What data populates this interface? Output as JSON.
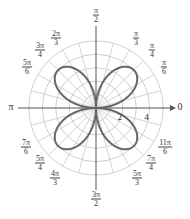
{
  "chart_data": {
    "type": "polar",
    "title": "",
    "equation": "r = 4 sin(2θ)",
    "series": [
      {
        "name": "rose curve",
        "function": "4*abs(sin(2*theta))",
        "petals": 4,
        "max_r": 4,
        "color": "#666666"
      }
    ],
    "radial_axis": {
      "rmax": 5,
      "circles": [
        1,
        2,
        3,
        4,
        5
      ],
      "tick_labels": [
        {
          "value": 2,
          "label": "2"
        },
        {
          "value": 4,
          "label": "4"
        }
      ]
    },
    "angular_axis": {
      "spokes_deg_step": 15,
      "labels": [
        {
          "angle_deg": 0,
          "num": "0",
          "den": ""
        },
        {
          "angle_deg": 30,
          "num": "π",
          "den": "6"
        },
        {
          "angle_deg": 45,
          "num": "π",
          "den": "4"
        },
        {
          "angle_deg": 60,
          "num": "π",
          "den": "3"
        },
        {
          "angle_deg": 90,
          "num": "π",
          "den": "2"
        },
        {
          "angle_deg": 120,
          "num": "2π",
          "den": "3"
        },
        {
          "angle_deg": 135,
          "num": "3π",
          "den": "4"
        },
        {
          "angle_deg": 150,
          "num": "5π",
          "den": "6"
        },
        {
          "angle_deg": 180,
          "num": "π",
          "den": ""
        },
        {
          "angle_deg": 210,
          "num": "7π",
          "den": "6"
        },
        {
          "angle_deg": 225,
          "num": "5π",
          "den": "4"
        },
        {
          "angle_deg": 240,
          "num": "4π",
          "den": "3"
        },
        {
          "angle_deg": 270,
          "num": "3π",
          "den": "2"
        },
        {
          "angle_deg": 300,
          "num": "5π",
          "den": "3"
        },
        {
          "angle_deg": 315,
          "num": "7π",
          "den": "4"
        },
        {
          "angle_deg": 330,
          "num": "11π",
          "den": "6"
        }
      ]
    },
    "grid": true
  },
  "layout": {
    "cx": 96,
    "cy": 108,
    "unit_px": 13.4,
    "label_positions": {
      "0": [
        180,
        106
      ],
      "30": [
        164,
        67
      ],
      "45": [
        152,
        50
      ],
      "60": [
        136,
        38
      ],
      "90": [
        96,
        15
      ],
      "120": [
        56,
        38
      ],
      "135": [
        40,
        50
      ],
      "150": [
        27,
        67
      ],
      "180": [
        11,
        106
      ],
      "210": [
        26,
        147
      ],
      "225": [
        40,
        163
      ],
      "240": [
        55,
        178
      ],
      "270": [
        96,
        199
      ],
      "300": [
        137,
        178
      ],
      "315": [
        151,
        163
      ],
      "330": [
        165,
        147
      ]
    },
    "colors": {
      "grid": "#c8c8c8",
      "axis": "#555555",
      "curve": "#666666",
      "text": "#333333"
    }
  }
}
